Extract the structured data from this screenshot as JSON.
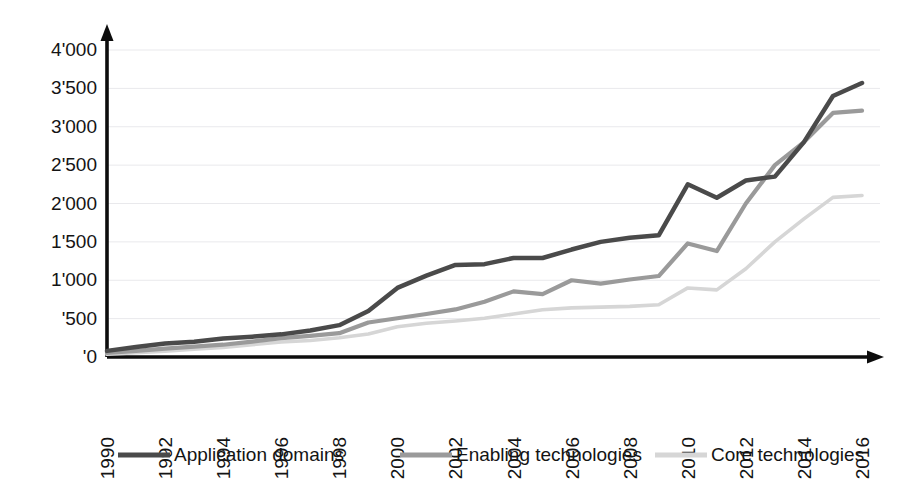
{
  "chart_data": {
    "type": "line",
    "title": "",
    "subtitle": "",
    "xlabel": "",
    "ylabel": "",
    "grid": true,
    "legend_position": "bottom",
    "xlim": [
      1990,
      2016
    ],
    "ylim": [
      0,
      4000
    ],
    "ytick_step": 500,
    "x": [
      1990,
      1991,
      1992,
      1993,
      1994,
      1995,
      1996,
      1997,
      1998,
      1999,
      2000,
      2001,
      2002,
      2003,
      2004,
      2005,
      2006,
      2007,
      2008,
      2009,
      2010,
      2011,
      2012,
      2013,
      2014,
      2015,
      2016
    ],
    "xtick_labels": [
      "1990",
      "1992",
      "1994",
      "1996",
      "1998",
      "2000",
      "2002",
      "2004",
      "2006",
      "2008",
      "2010",
      "2012",
      "2014",
      "2016"
    ],
    "ytick_labels": [
      "4'000",
      "3'500",
      "3'000",
      "2'500",
      "2'000",
      "1'500",
      "1'000",
      "'500",
      "'0"
    ],
    "ytick_values": [
      4000,
      3500,
      3000,
      2500,
      2000,
      1500,
      1000,
      500,
      0
    ],
    "series": [
      {
        "name": "Application domains",
        "color": "#4a4a4a",
        "width": 4.5,
        "values": [
          80,
          130,
          175,
          200,
          240,
          265,
          295,
          345,
          415,
          600,
          900,
          1060,
          1200,
          1210,
          1290,
          1290,
          1400,
          1500,
          1555,
          1585,
          2250,
          2075,
          2300,
          2350,
          2800,
          3400,
          3570
        ]
      },
      {
        "name": "Enabling technologies",
        "color": "#9a9a9a",
        "width": 4.2,
        "values": [
          55,
          80,
          110,
          135,
          160,
          200,
          245,
          275,
          310,
          450,
          505,
          560,
          620,
          720,
          855,
          820,
          1000,
          955,
          1010,
          1055,
          1480,
          1380,
          2000,
          2500,
          2800,
          3180,
          3210
        ]
      },
      {
        "name": "Core technologies",
        "color": "#d6d6d6",
        "width": 3.6,
        "values": [
          35,
          55,
          75,
          100,
          125,
          160,
          195,
          215,
          250,
          300,
          395,
          440,
          470,
          505,
          560,
          615,
          640,
          650,
          660,
          680,
          900,
          875,
          1150,
          1500,
          1800,
          2080,
          2105
        ]
      }
    ]
  },
  "legend": {
    "items": [
      {
        "label": "Application domains",
        "color": "#4a4a4a"
      },
      {
        "label": "Enabling technologies",
        "color": "#9a9a9a"
      },
      {
        "label": "Core technologies",
        "color": "#d6d6d6"
      }
    ]
  },
  "axes": {
    "y_axis_name": "value-axis",
    "x_axis_name": "year-axis"
  }
}
